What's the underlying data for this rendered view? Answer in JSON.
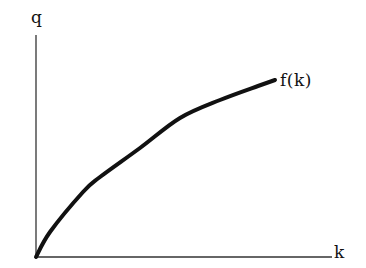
{
  "chart_data": {
    "type": "line",
    "title": "",
    "xlabel": "k",
    "ylabel": "q",
    "grid": false,
    "legend": null,
    "annotations": [
      {
        "text": "f(k)",
        "position": "end-of-curve"
      }
    ],
    "axis_ranges": {
      "x": [
        0,
        296
      ],
      "y": [
        0,
        222
      ]
    },
    "series": [
      {
        "name": "f(k)",
        "color": "#111111",
        "x": [
          0,
          14,
          47,
          64,
          104,
          144,
          184,
          222,
          239
        ],
        "y": [
          0,
          25,
          65,
          80,
          109,
          139,
          157,
          171,
          177
        ]
      }
    ],
    "tick_labels": {
      "x": [],
      "y": []
    }
  },
  "labels": {
    "y_axis": "q",
    "x_axis": "k",
    "curve": "f(k)"
  },
  "colors": {
    "axis": "#333333",
    "curve": "#111111",
    "background": "#ffffff"
  }
}
